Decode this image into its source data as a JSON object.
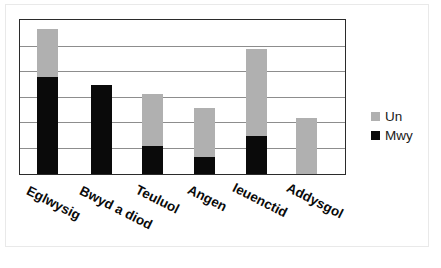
{
  "chart_data": {
    "type": "bar",
    "stacked": true,
    "title": "",
    "subtitle": "",
    "xlabel": "",
    "ylabel": "",
    "categories": [
      "Eglwysig",
      "Bwyd a diod",
      "Teuluol",
      "Angen",
      "Ieuenctid",
      "Addysgol"
    ],
    "series": [
      {
        "name": "Mwy",
        "color": "#0a0a0a",
        "values": [
          3.8,
          3.5,
          1.1,
          0.65,
          1.5,
          0
        ]
      },
      {
        "name": "Un",
        "color": "#b0b0b0",
        "values": [
          1.9,
          0,
          2.05,
          1.95,
          3.4,
          2.2
        ]
      }
    ],
    "totals": [
      5.7,
      3.5,
      3.15,
      2.6,
      4.9,
      2.2
    ],
    "ylim": [
      0,
      6
    ],
    "yticks": [
      0,
      1,
      2,
      3,
      4,
      5,
      6
    ],
    "ytick_labels": [
      "",
      "",
      "",
      "",
      "",
      "",
      ""
    ],
    "grid": true,
    "grid_axis": "y",
    "legend_position": "right"
  },
  "legend": {
    "items": [
      {
        "label": "Un",
        "color": "#b0b0b0"
      },
      {
        "label": "Mwy",
        "color": "#0a0a0a"
      }
    ]
  },
  "axes": {
    "border_color": "#2b2b2b",
    "gridline_color": "#8d8d8d"
  }
}
